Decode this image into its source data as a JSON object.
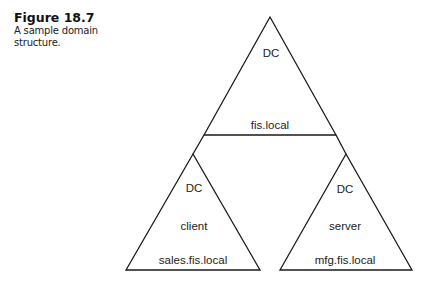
{
  "caption": {
    "figure_label": "Figure 18.7",
    "description_line1": "A sample domain",
    "description_line2": "structure."
  },
  "diagram": {
    "root": {
      "label_top": "DC",
      "label_bottom": "fis.local"
    },
    "children": [
      {
        "label_top": "DC",
        "label_middle": "client",
        "label_bottom": "sales.fis.local"
      },
      {
        "label_top": "DC",
        "label_middle": "server",
        "label_bottom": "mfg.fis.local"
      }
    ]
  }
}
